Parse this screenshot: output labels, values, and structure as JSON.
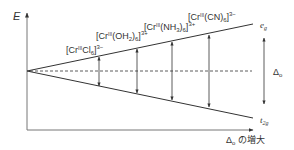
{
  "diagram": {
    "y_axis_label": "E",
    "x_axis_label_symbol": "Δ",
    "x_axis_label_sub": "o",
    "x_axis_label_text": " の増大",
    "upper_level_label": "e",
    "upper_level_sub": "g",
    "lower_level_label": "t",
    "lower_level_sub": "2g",
    "delta_label": "Δ",
    "delta_sub": "o",
    "complexes": [
      {
        "name": "cr-cl6",
        "prefix": "[Cr",
        "ox": "III",
        "ligand": "Cl",
        "lsub": "6",
        "close": "]",
        "charge": "3−"
      },
      {
        "name": "cr-oh2-6",
        "prefix": "[Cr",
        "ox": "III",
        "ligand": "(OH",
        "lsub": "2",
        "ligclose": ")",
        "lsub2": "6",
        "close": "]",
        "charge": "3+"
      },
      {
        "name": "cr-nh3-6",
        "prefix": "[Cr",
        "ox": "III",
        "ligand": "(NH",
        "lsub": "3",
        "ligclose": ")",
        "lsub2": "6",
        "close": "]",
        "charge": "3+"
      },
      {
        "name": "cr-cn6",
        "prefix": "[Cr",
        "ox": "III",
        "ligand": "(CN)",
        "lsub": "6",
        "close": "]",
        "charge": "3−"
      }
    ],
    "colors": {
      "line": "#333333",
      "axis": "#666666"
    }
  }
}
